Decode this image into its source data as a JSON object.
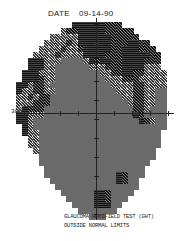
{
  "header": {
    "date_label": "DATE",
    "date_value": "09-14-90"
  },
  "axis": {
    "eccentricity_label": "30°"
  },
  "result": {
    "test_name": "GLAUCOMA HEMIFIELD TEST (GHT)",
    "outcome": "OUTSIDE NORMAL LIMITS"
  },
  "greyscale_map": {
    "cell_size": 6,
    "cols": 25,
    "rows": 33,
    "rows_data": [
      "000000000055555544400000000",
      "000000003445555544444000000",
      "000000333335555554444400000",
      "000003333435555554445544000",
      "000033334334555554455544400",
      "000333343333555544455555440",
      "005553332222354554455554440",
      "005553322222233344455553330",
      "055533322222222334455443333",
      "055543322222222233344433333",
      "553443222222222223333443333",
      "533443322222222222333443322",
      "334344222222222222233443322",
      "333444222222222222223443322",
      "354442222222222222222443222",
      "553332222222222222222542222",
      "553222222222222222222254322",
      "053222222222222222222222222",
      "053322222222222222222222220",
      "003322222222222222222222220",
      "003322222222222222222222220",
      "000322222222222222222222200",
      "000022222222222222222222200",
      "000022222222222222222222000",
      "000002222222222222222220000",
      "000002222222222222542220000",
      "000000222222222222542200000",
      "000000022222222222222200000",
      "000000002222225542222000000",
      "000000000222225542220000000",
      "000000000022225552200000000",
      "000000000002222222000000000",
      "000000000000022200000000000"
    ]
  }
}
